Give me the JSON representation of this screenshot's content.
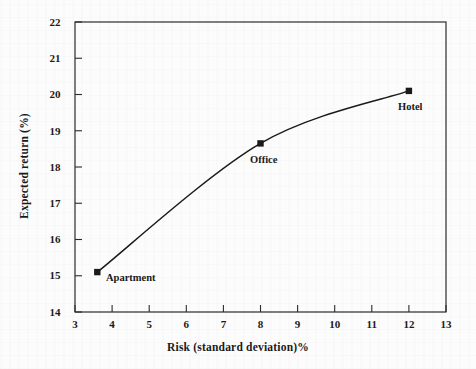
{
  "chart_data": {
    "type": "line",
    "title": "",
    "xlabel": "Risk (standard deviation)%",
    "ylabel": "Expected return (%)",
    "xlim": [
      3,
      13
    ],
    "ylim": [
      14,
      22
    ],
    "xticks": [
      3,
      4,
      5,
      6,
      7,
      8,
      9,
      10,
      11,
      12,
      13
    ],
    "yticks": [
      14,
      15,
      16,
      17,
      18,
      19,
      20,
      21,
      22
    ],
    "xtick_labels": [
      "3",
      "4",
      "5",
      "6",
      "7",
      "8",
      "9",
      "10",
      "11",
      "12",
      "13"
    ],
    "ytick_labels": [
      "14",
      "15",
      "16",
      "17",
      "18",
      "19",
      "20",
      "21",
      "22"
    ],
    "grid": false,
    "legend": "none",
    "marker": "filled-square",
    "line_color": "#1a1a1a",
    "series": [
      {
        "name": "Risk-return frontier",
        "x": [
          3.6,
          8.0,
          12.0
        ],
        "y": [
          15.1,
          18.65,
          20.1
        ],
        "point_labels": [
          "Apartment",
          "Office",
          "Hotel"
        ]
      }
    ],
    "annotations": [
      {
        "text": "Apartment",
        "x": 3.6,
        "y": 15.1,
        "position": "right"
      },
      {
        "text": "Office",
        "x": 8.0,
        "y": 18.65,
        "position": "below-right"
      },
      {
        "text": "Hotel",
        "x": 12.0,
        "y": 20.1,
        "position": "below-right"
      }
    ]
  },
  "axes": {
    "x_title": "Risk (standard deviation)%",
    "y_title": "Expected return (%)"
  },
  "ticks": {
    "x": [
      "3",
      "4",
      "5",
      "6",
      "7",
      "8",
      "9",
      "10",
      "11",
      "12",
      "13"
    ],
    "y": [
      "22",
      "21",
      "20",
      "19",
      "18",
      "17",
      "16",
      "15",
      "14"
    ]
  },
  "points": {
    "apartment": "Apartment",
    "office": "Office",
    "hotel": "Hotel"
  }
}
